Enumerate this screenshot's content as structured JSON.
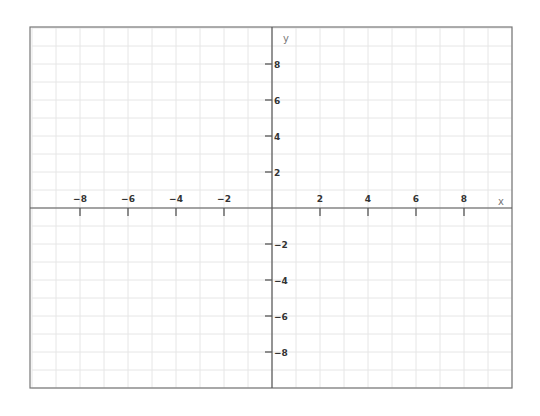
{
  "chart_data": {
    "type": "coordinate-plane",
    "title": "",
    "xlabel": "x",
    "ylabel": "y",
    "xlim": [
      -10,
      10
    ],
    "ylim": [
      -10,
      10
    ],
    "grid": true,
    "grid_step": 1,
    "x_ticks": [
      -8,
      -6,
      -4,
      -2,
      2,
      4,
      6,
      8
    ],
    "y_ticks": [
      8,
      6,
      4,
      2,
      -2,
      -4,
      -6,
      -8
    ],
    "x_tick_labels": [
      "−8",
      "−6",
      "−4",
      "−2",
      "2",
      "4",
      "6",
      "8"
    ],
    "y_tick_labels": [
      "8",
      "6",
      "4",
      "2",
      "−2",
      "−4",
      "−6",
      "−8"
    ],
    "series": []
  },
  "layout": {
    "plot_left": 32,
    "plot_top": 28,
    "plot_right": 512,
    "plot_bottom": 388,
    "origin_x": 272,
    "origin_y": 208,
    "px_per_unit_x": 24,
    "px_per_unit_y": 18
  },
  "colors": {
    "grid": "#e6e6e6",
    "axis": "#555555",
    "border": "#777777",
    "label": "#333333",
    "axis_name": "#777777"
  }
}
